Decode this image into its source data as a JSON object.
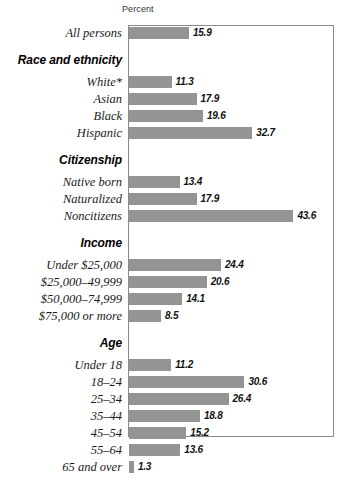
{
  "axis": {
    "caption": "Percent"
  },
  "chart_data": {
    "type": "bar",
    "orientation": "horizontal",
    "title": "",
    "xlabel": "Percent",
    "ylabel": "",
    "xlim": [
      0,
      54.7
    ],
    "grid": false,
    "legend": null,
    "bar_color": "#949494",
    "frame_color": "#8a8a8a",
    "value_label_format": "one-decimal",
    "footnote_marker": "*",
    "categories": [
      "All persons",
      "White*",
      "Asian",
      "Black",
      "Hispanic",
      "Native born",
      "Naturalized",
      "Noncitizens",
      "Under $25,000",
      "$25,000–49,999",
      "$50,000–74,999",
      "$75,000 or more",
      "Under 18",
      "18–24",
      "25–34",
      "35–44",
      "45–54",
      "55–64",
      "65 and over"
    ],
    "values": [
      15.9,
      11.3,
      17.9,
      19.6,
      32.7,
      13.4,
      17.9,
      43.6,
      24.4,
      20.6,
      14.1,
      8.5,
      11.2,
      30.6,
      26.4,
      18.8,
      15.2,
      13.6,
      1.3
    ],
    "group_headers": [
      "Race and ethnicity",
      "Citizenship",
      "Income",
      "Age"
    ],
    "groups": [
      {
        "header": "",
        "items": [
          {
            "label": "All persons",
            "value": 15.9
          }
        ]
      },
      {
        "header": "Race and ethnicity",
        "items": [
          {
            "label": "White*",
            "value": 11.3
          },
          {
            "label": "Asian",
            "value": 17.9
          },
          {
            "label": "Black",
            "value": 19.6
          },
          {
            "label": "Hispanic",
            "value": 32.7
          }
        ]
      },
      {
        "header": "Citizenship",
        "items": [
          {
            "label": "Native born",
            "value": 13.4
          },
          {
            "label": "Naturalized",
            "value": 17.9
          },
          {
            "label": "Noncitizens",
            "value": 43.6
          }
        ]
      },
      {
        "header": "Income",
        "items": [
          {
            "label": "Under $25,000",
            "value": 24.4
          },
          {
            "label": "$25,000–49,999",
            "value": 20.6
          },
          {
            "label": "$50,000–74,999",
            "value": 14.1
          },
          {
            "label": "$75,000 or more",
            "value": 8.5
          }
        ]
      },
      {
        "header": "Age",
        "items": [
          {
            "label": "Under 18",
            "value": 11.2
          },
          {
            "label": "18–24",
            "value": 30.6
          },
          {
            "label": "25–34",
            "value": 26.4
          },
          {
            "label": "35–44",
            "value": 18.8
          },
          {
            "label": "45–54",
            "value": 15.2
          },
          {
            "label": "55–64",
            "value": 13.6
          },
          {
            "label": "65 and over",
            "value": 1.3
          }
        ]
      }
    ]
  }
}
